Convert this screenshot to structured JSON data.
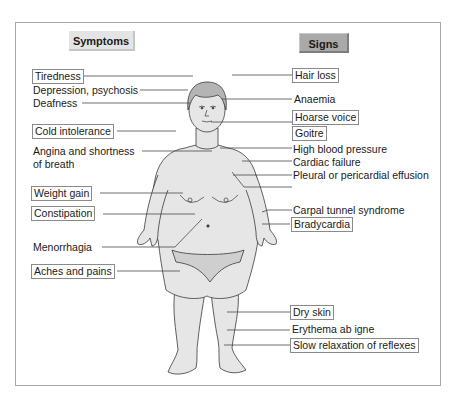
{
  "headers": {
    "symptoms": "Symptoms",
    "signs": "Signs"
  },
  "symptoms": [
    {
      "label": "Tiredness",
      "boxed": true
    },
    {
      "label": "Depression, psychosis",
      "boxed": false
    },
    {
      "label": "Deafness",
      "boxed": false
    },
    {
      "label": "Cold intolerance",
      "boxed": true
    },
    {
      "label": "Angina and shortness",
      "boxed": false
    },
    {
      "label": "of breath",
      "boxed": false
    },
    {
      "label": "Weight gain",
      "boxed": true
    },
    {
      "label": "Constipation",
      "boxed": true
    },
    {
      "label": "Menorrhagia",
      "boxed": false
    },
    {
      "label": "Aches and pains",
      "boxed": true
    }
  ],
  "signs": [
    {
      "label": "Hair loss",
      "boxed": true
    },
    {
      "label": "Anaemia",
      "boxed": false
    },
    {
      "label": "Hoarse voice",
      "boxed": true
    },
    {
      "label": "Goitre",
      "boxed": true
    },
    {
      "label": "High blood pressure",
      "boxed": false
    },
    {
      "label": "Cardiac failure",
      "boxed": false
    },
    {
      "label": "Pleural or pericardial effusion",
      "boxed": false
    },
    {
      "label": "Carpal tunnel syndrome",
      "boxed": false
    },
    {
      "label": "Bradycardia",
      "boxed": true
    },
    {
      "label": "Dry skin",
      "boxed": true
    },
    {
      "label": "Erythema ab igne",
      "boxed": false
    },
    {
      "label": "Slow relaxation of reflexes",
      "boxed": true
    }
  ],
  "colors": {
    "skin": "#e6e6e6",
    "hair": "#b4b4b4",
    "underwear": "#cfcfcf",
    "outline": "#3a3a3a",
    "leader": "#4a4a4a"
  }
}
